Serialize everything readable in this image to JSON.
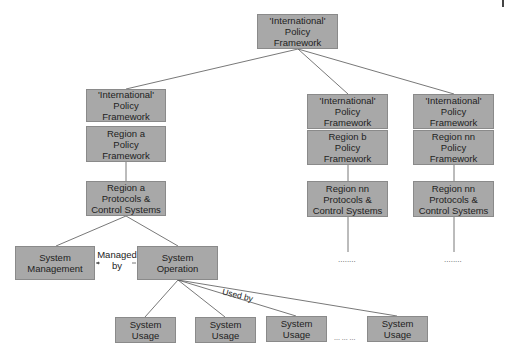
{
  "diagram": {
    "root": {
      "label": "'International'\nPolicy\nFramework"
    },
    "columns": [
      {
        "intl": "'International'\nPolicy\nFramework",
        "region": "Region a\nPolicy\nFramework",
        "protocols": "Region a\nProtocols &\nControl Systems"
      },
      {
        "intl": "'International'\nPolicy\nFramework",
        "region": "Region b\nPolicy\nFramework",
        "protocols": "Region nn\nProtocols &\nControl Systems",
        "continuation": "........"
      },
      {
        "intl": "'International'\nPolicy\nFramework",
        "region": "Region nn\nPolicy\nFramework",
        "protocols": "Region nn\nProtocols &\nControl Systems",
        "continuation": "........"
      }
    ],
    "system_management": "System\nManagement",
    "system_operation": "System\nOperation",
    "managed_by_label": "Managed\nby",
    "used_by_label": "Used by",
    "usage_boxes": [
      "System\nUsage",
      "System\nUsage",
      "System\nUsage",
      "System\nUsage"
    ],
    "usage_continuation": "... ... ..."
  },
  "colors": {
    "box_fill": "#a8a8a8",
    "box_border": "#8a8a8a",
    "line": "#555555"
  }
}
